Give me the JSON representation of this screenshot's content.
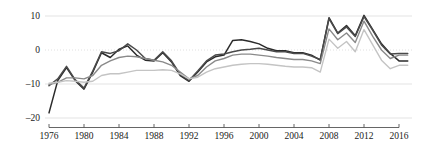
{
  "chart_data": {
    "type": "line",
    "title": "",
    "subtitle": "",
    "xlabel": "",
    "ylabel": "",
    "xlim": [
      1976,
      2017
    ],
    "ylim": [
      -22,
      13
    ],
    "yticks": [
      10,
      0,
      -10,
      -20
    ],
    "ytick_labels": [
      "10",
      "0",
      "–10",
      "–20"
    ],
    "xticks": [
      1976,
      1980,
      1984,
      1988,
      1992,
      1996,
      2000,
      2004,
      2008,
      2012,
      2016
    ],
    "xtick_labels": [
      "1976",
      "1980",
      "1984",
      "1988",
      "1992",
      "1996",
      "2000",
      "2004",
      "2008",
      "2012",
      "2016"
    ],
    "grid": true,
    "grid_style": "dotted-horizontal",
    "legend": false,
    "legend_position": "none",
    "x": [
      1976,
      1977,
      1978,
      1979,
      1980,
      1981,
      1982,
      1983,
      1984,
      1985,
      1986,
      1987,
      1988,
      1989,
      1990,
      1991,
      1992,
      1993,
      1994,
      1995,
      1996,
      1997,
      1998,
      1999,
      2000,
      2001,
      2002,
      2003,
      2004,
      2005,
      2006,
      2007,
      2008,
      2009,
      2010,
      2011,
      2012,
      2013,
      2014,
      2015,
      2016,
      2017
    ],
    "series": [
      {
        "name": "series-1",
        "color": "#2b2b2b",
        "width": 1.5,
        "values": [
          -18.5,
          -9.0,
          -5.2,
          -9.0,
          -11.5,
          -6.5,
          -0.8,
          -2.2,
          0.2,
          1.2,
          -1.5,
          -3.0,
          -3.2,
          -0.8,
          -3.5,
          -7.5,
          -9.2,
          -6.5,
          -3.5,
          -2.0,
          -1.5,
          2.8,
          3.0,
          2.5,
          1.8,
          0.5,
          -0.2,
          -0.2,
          -0.8,
          -0.8,
          -1.5,
          -3.0,
          9.5,
          5.0,
          7.2,
          4.2,
          10.2,
          6.0,
          1.8,
          -1.0,
          -3.2,
          -3.2
        ]
      },
      {
        "name": "series-2",
        "color": "#4a4a4a",
        "width": 1.5,
        "values": [
          -10.5,
          -8.5,
          -4.8,
          -8.8,
          -11.2,
          -6.2,
          -0.5,
          -1.0,
          -0.2,
          1.8,
          0.0,
          -2.5,
          -3.0,
          -0.5,
          -3.2,
          -7.2,
          -9.0,
          -6.2,
          -3.2,
          -1.5,
          -1.2,
          -0.5,
          0.0,
          0.2,
          0.5,
          0.0,
          -0.5,
          -0.5,
          -1.0,
          -1.0,
          -1.8,
          -2.8,
          9.2,
          4.8,
          6.8,
          4.0,
          9.8,
          5.8,
          1.5,
          -1.2,
          -1.0,
          -1.0
        ]
      },
      {
        "name": "series-3",
        "color": "#8a8a8a",
        "width": 1.4,
        "values": [
          -10.2,
          -9.5,
          -8.2,
          -8.2,
          -8.5,
          -7.5,
          -4.5,
          -3.2,
          -2.2,
          -1.8,
          -2.0,
          -2.5,
          -3.0,
          -3.5,
          -4.5,
          -6.5,
          -8.5,
          -7.5,
          -5.0,
          -3.2,
          -2.5,
          -1.5,
          -1.2,
          -1.2,
          -1.5,
          -1.8,
          -2.2,
          -2.5,
          -2.8,
          -2.8,
          -3.2,
          -4.0,
          6.2,
          3.0,
          5.0,
          2.2,
          8.5,
          4.0,
          0.0,
          -2.5,
          -1.5,
          -1.5
        ]
      },
      {
        "name": "series-4",
        "color": "#c4c4c4",
        "width": 1.4,
        "values": [
          -9.8,
          -9.5,
          -9.0,
          -9.2,
          -9.5,
          -9.2,
          -7.5,
          -7.0,
          -7.0,
          -6.5,
          -6.0,
          -6.0,
          -6.0,
          -5.8,
          -6.0,
          -7.0,
          -8.5,
          -8.0,
          -6.5,
          -5.5,
          -5.0,
          -4.5,
          -4.2,
          -4.0,
          -4.0,
          -4.2,
          -4.5,
          -4.8,
          -5.0,
          -5.0,
          -5.2,
          -6.5,
          3.2,
          0.5,
          2.5,
          -0.5,
          6.0,
          1.5,
          -3.0,
          -5.5,
          -4.5,
          -4.5
        ]
      }
    ]
  }
}
